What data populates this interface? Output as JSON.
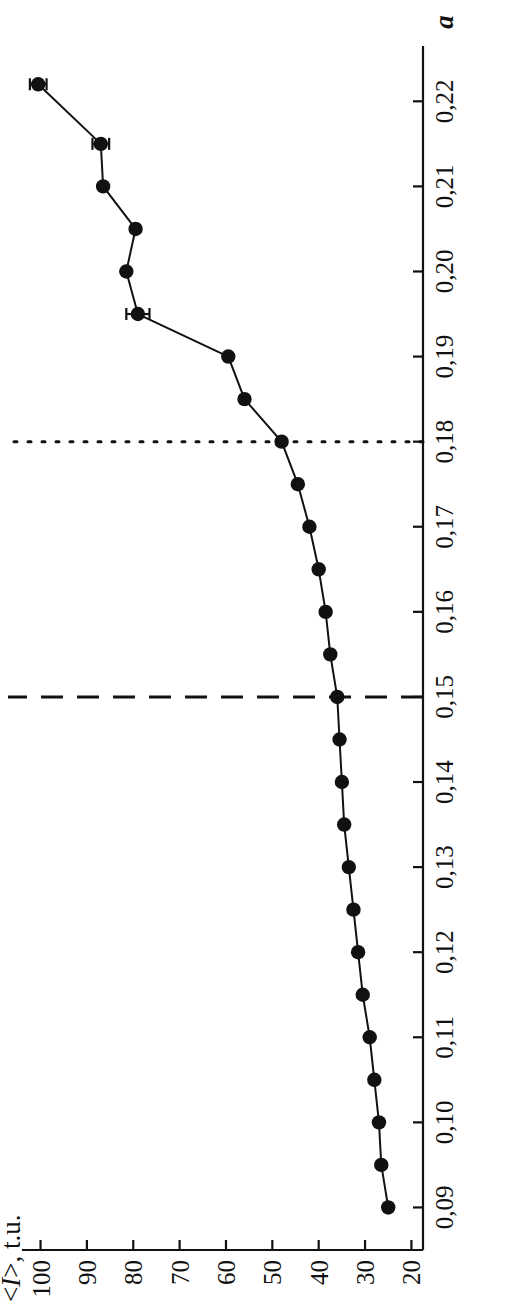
{
  "chart_data": {
    "type": "line",
    "title": "",
    "xlabel": "a",
    "ylabel": "<I>, t.u.",
    "xlim": [
      0.085,
      0.2265
    ],
    "ylim": [
      17.5,
      104
    ],
    "grid": false,
    "legend": null,
    "xticks": [
      "0,09",
      "0,10",
      "0,11",
      "0,12",
      "0,13",
      "0,14",
      "0,15",
      "0,16",
      "0,17",
      "0,18",
      "0,19",
      "0,20",
      "0,21",
      "0,22"
    ],
    "xtick_values": [
      0.09,
      0.1,
      0.11,
      0.12,
      0.13,
      0.14,
      0.15,
      0.16,
      0.17,
      0.18,
      0.19,
      0.2,
      0.21,
      0.22
    ],
    "yticks": [
      "20",
      "30",
      "40",
      "50",
      "60",
      "70",
      "80",
      "90",
      "100"
    ],
    "ytick_values": [
      20,
      30,
      40,
      50,
      60,
      70,
      80,
      90,
      100
    ],
    "marker": "filled-circle",
    "line_color": "#111111",
    "marker_color": "#111111",
    "x": [
      0.09,
      0.095,
      0.1,
      0.105,
      0.11,
      0.115,
      0.12,
      0.125,
      0.13,
      0.135,
      0.14,
      0.145,
      0.15,
      0.155,
      0.16,
      0.165,
      0.17,
      0.175,
      0.18,
      0.185,
      0.19,
      0.195,
      0.2,
      0.205,
      0.21,
      0.215,
      0.222
    ],
    "y": [
      25.0,
      26.5,
      27.0,
      28.0,
      29.0,
      30.5,
      31.5,
      32.5,
      33.5,
      34.5,
      35.0,
      35.5,
      36.0,
      37.5,
      38.5,
      40.0,
      42.0,
      44.5,
      48.0,
      56.0,
      59.5,
      79.0,
      81.5,
      79.5,
      86.5,
      87.0,
      100.5
    ],
    "series": [
      {
        "name": "<I>, t.u.",
        "points": [
          {
            "x": 0.09,
            "y": 25.0,
            "err": 0
          },
          {
            "x": 0.095,
            "y": 26.5,
            "err": 0
          },
          {
            "x": 0.1,
            "y": 27.0,
            "err": 0
          },
          {
            "x": 0.105,
            "y": 28.0,
            "err": 0
          },
          {
            "x": 0.11,
            "y": 29.0,
            "err": 0
          },
          {
            "x": 0.115,
            "y": 30.5,
            "err": 0
          },
          {
            "x": 0.12,
            "y": 31.5,
            "err": 0
          },
          {
            "x": 0.125,
            "y": 32.5,
            "err": 0
          },
          {
            "x": 0.13,
            "y": 33.5,
            "err": 0
          },
          {
            "x": 0.135,
            "y": 34.5,
            "err": 0
          },
          {
            "x": 0.14,
            "y": 35.0,
            "err": 0
          },
          {
            "x": 0.145,
            "y": 35.5,
            "err": 0
          },
          {
            "x": 0.15,
            "y": 36.0,
            "err": 0
          },
          {
            "x": 0.155,
            "y": 37.5,
            "err": 0
          },
          {
            "x": 0.16,
            "y": 38.5,
            "err": 0
          },
          {
            "x": 0.165,
            "y": 40.0,
            "err": 0
          },
          {
            "x": 0.17,
            "y": 42.0,
            "err": 0
          },
          {
            "x": 0.175,
            "y": 44.5,
            "err": 0
          },
          {
            "x": 0.18,
            "y": 48.0,
            "err": 0
          },
          {
            "x": 0.185,
            "y": 56.0,
            "err": 0
          },
          {
            "x": 0.19,
            "y": 59.5,
            "err": 0
          },
          {
            "x": 0.195,
            "y": 79.0,
            "err": 2.5
          },
          {
            "x": 0.2,
            "y": 81.5,
            "err": 0
          },
          {
            "x": 0.205,
            "y": 79.5,
            "err": 0
          },
          {
            "x": 0.21,
            "y": 86.5,
            "err": 0
          },
          {
            "x": 0.215,
            "y": 87.0,
            "err": 1.8
          },
          {
            "x": 0.222,
            "y": 100.5,
            "err": 1.8
          }
        ]
      }
    ],
    "reference_lines": [
      {
        "name": "dashed-reference-line",
        "axis": "x",
        "value": 0.15,
        "style": "dashed",
        "label": ""
      },
      {
        "name": "dotted-reference-line",
        "axis": "x",
        "value": 0.18,
        "style": "dotted",
        "label": ""
      }
    ]
  }
}
